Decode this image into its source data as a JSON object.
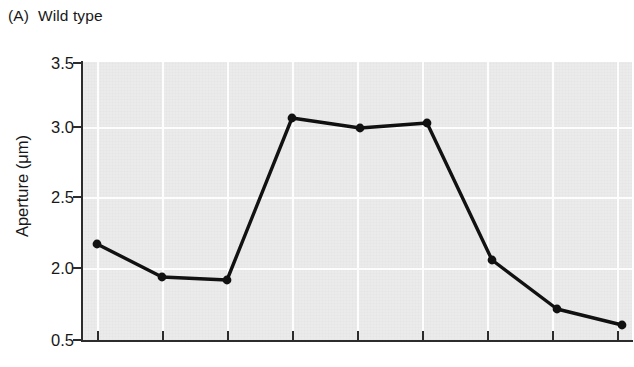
{
  "panel": {
    "letter": "(A)",
    "title": "Wild type",
    "full_title": "(A)  Wild type"
  },
  "axes": {
    "y_label": "Aperture (μm)",
    "x_label": "",
    "y_tick_labels": [
      "3.5",
      "3.0",
      "2.5",
      "2.0",
      "0.5"
    ],
    "y_tick_pixel_y": [
      63,
      127,
      197,
      268,
      340
    ],
    "axis_break": true,
    "x_tick_count": 9,
    "x_tick_labels": []
  },
  "colors": {
    "plot_background": "#ebebeb",
    "gridline": "#fdfdfd",
    "axis": "#2c2c2c",
    "series_line": "#111111",
    "marker": "#111111",
    "page_background": "#ffffff",
    "text": "#181818"
  },
  "chart_data": {
    "type": "line",
    "xlabel": "",
    "ylabel": "Aperture (μm)",
    "ylim": [
      0.5,
      3.5
    ],
    "y_ticks": [
      0.5,
      2.0,
      2.5,
      3.0,
      3.5
    ],
    "y_tick_labels": [
      "0.5",
      "2.0",
      "2.5",
      "3.0",
      "3.5"
    ],
    "axis_break_note": "y axis compressed between 0.5 and 2.0",
    "grid": true,
    "legend": null,
    "x": [
      1,
      2,
      3,
      4,
      5,
      6,
      7,
      8,
      9
    ],
    "values": [
      2.17,
      1.92,
      1.9,
      3.08,
      3.01,
      3.05,
      2.06,
      0.68,
      0.58
    ],
    "series": [
      {
        "name": "Wild type",
        "values": [
          2.17,
          1.92,
          1.9,
          3.08,
          3.01,
          3.05,
          2.06,
          0.68,
          0.58
        ]
      }
    ],
    "marker": "circle",
    "marker_size": 6
  },
  "geometry": {
    "plot_left": 82,
    "plot_top": 62,
    "plot_width": 550,
    "plot_height": 278,
    "point_pixels": [
      {
        "x": 97,
        "y": 244
      },
      {
        "x": 162,
        "y": 277
      },
      {
        "x": 227,
        "y": 280
      },
      {
        "x": 292,
        "y": 118
      },
      {
        "x": 360,
        "y": 128
      },
      {
        "x": 427,
        "y": 123
      },
      {
        "x": 492,
        "y": 260
      },
      {
        "x": 557,
        "y": 309
      },
      {
        "x": 622,
        "y": 325
      }
    ],
    "gridline_v_x": [
      97,
      162,
      227,
      292,
      357,
      422,
      487,
      552,
      617
    ],
    "gridline_h_y": [
      127,
      197,
      268
    ],
    "tick_x_positions": [
      97,
      162,
      227,
      292,
      357,
      422,
      487,
      552,
      617
    ]
  }
}
